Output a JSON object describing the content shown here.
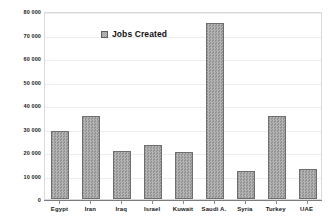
{
  "chart_data": {
    "type": "bar",
    "title": "",
    "xlabel": "",
    "ylabel": "",
    "categories": [
      "Egypt",
      "Iran",
      "Iraq",
      "Israel",
      "Kuwait",
      "Saudi A.",
      "Syria",
      "Turkey",
      "UAE"
    ],
    "values": [
      29000,
      35500,
      20500,
      23000,
      20000,
      74800,
      12100,
      35500,
      12800
    ],
    "series": [
      {
        "name": "Jobs Created",
        "values": [
          29000,
          35500,
          20500,
          23000,
          20000,
          74800,
          12100,
          35500,
          12800
        ]
      }
    ],
    "ylim": [
      0,
      80000
    ],
    "ytick_values": [
      0,
      10000,
      20000,
      30000,
      40000,
      50000,
      60000,
      70000,
      80000
    ],
    "ytick_labels": [
      "0",
      "10 000",
      "20 000",
      "30 000",
      "40 000",
      "50 000",
      "60 000",
      "70 000",
      "80 000"
    ],
    "grid": true,
    "legend": {
      "position": "top-left-inside",
      "entries": [
        "Jobs Created"
      ],
      "marker": "legend-swatch"
    },
    "colors": {
      "bar_fill": "#939393",
      "bar_border": "#6e6e6e",
      "gridline": "#ededed",
      "axis": "#7b7b7b",
      "plot_border": "#d9d9d9",
      "text": "#1a1a1a",
      "background": "#ffffff"
    }
  },
  "legend": {
    "label": "Jobs Created"
  }
}
